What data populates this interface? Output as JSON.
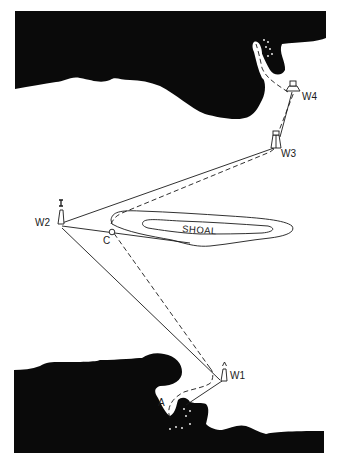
{
  "diagram": {
    "type": "nautical-chart",
    "colors": {
      "land": "#0a0a0a",
      "water": "#ffffff",
      "line": "#1a1a1a"
    },
    "labels": {
      "w1": "W1",
      "w2": "W2",
      "w3": "W3",
      "w4": "W4",
      "c": "C",
      "a": "A",
      "shoal": "SHOAL"
    },
    "features": [
      {
        "id": "north-coast",
        "kind": "land"
      },
      {
        "id": "south-coast",
        "kind": "land"
      },
      {
        "id": "shoal",
        "kind": "shoal",
        "label": "SHOAL"
      },
      {
        "id": "W1",
        "kind": "lighthouse"
      },
      {
        "id": "W2",
        "kind": "beacon"
      },
      {
        "id": "W3",
        "kind": "tower"
      },
      {
        "id": "W4",
        "kind": "building"
      },
      {
        "id": "C",
        "kind": "clearing-point"
      },
      {
        "id": "A",
        "kind": "anchorage"
      }
    ],
    "routes": [
      {
        "style": "solid",
        "description": "bearing lines W1-W2, W2-W3, W2 past C, W1 to A"
      },
      {
        "style": "dashed",
        "description": "track from A via W1, C, toward W3, W4 into the northern inlet"
      }
    ]
  }
}
